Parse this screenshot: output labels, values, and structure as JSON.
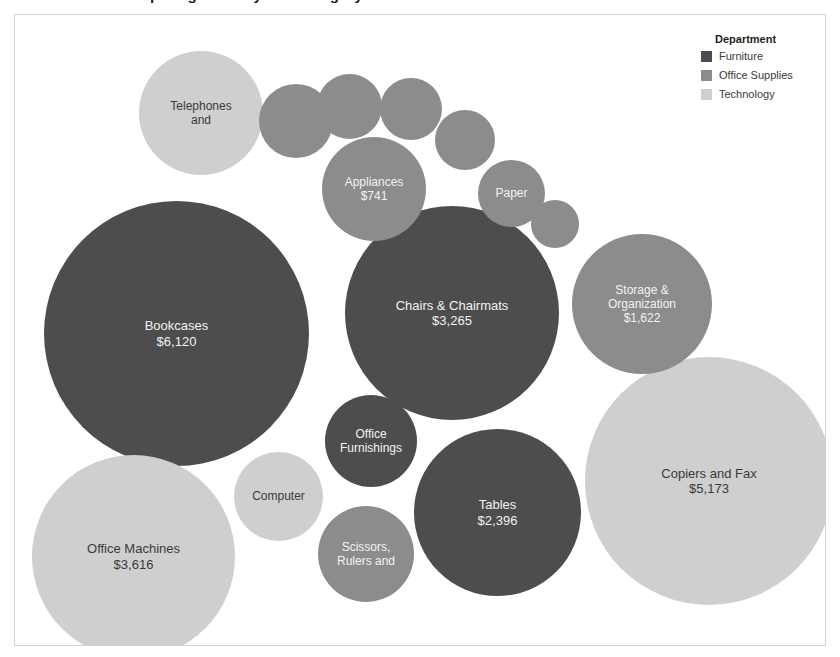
{
  "chart_title": "Bubble chart comparing sales by sub-category",
  "legend": {
    "title": "Department",
    "entries": [
      {
        "label": "Furniture",
        "color": "#4d4d4d"
      },
      {
        "label": "Office Supplies",
        "color": "#8c8c8c"
      },
      {
        "label": "Technology",
        "color": "#cfcfcf"
      }
    ]
  },
  "chart_data": {
    "type": "bubble",
    "title": "Bubble chart comparing sales by sub-category",
    "xlabel": "",
    "ylabel": "",
    "grid": false,
    "legend_position": "top-right",
    "legend_title": "Department",
    "categories": [
      "Furniture",
      "Office Supplies",
      "Technology"
    ],
    "category_colors": {
      "Furniture": "#4d4d4d",
      "Office Supplies": "#8c8c8c",
      "Technology": "#cfcfcf"
    },
    "value_prefix": "$",
    "points": [
      {
        "name": "Bookcases",
        "value": 6120,
        "value_label": "$6,120",
        "label": "Bookcases\n$6,120",
        "category": "Furniture"
      },
      {
        "name": "Copiers and Fax",
        "value": 5173,
        "value_label": "$5,173",
        "label": "Copiers and Fax\n$5,173",
        "category": "Technology"
      },
      {
        "name": "Office Machines",
        "value": 3616,
        "value_label": "$3,616",
        "label": "Office Machines\n$3,616",
        "category": "Technology"
      },
      {
        "name": "Chairs & Chairmats",
        "value": 3265,
        "value_label": "$3,265",
        "label": "Chairs & Chairmats\n$3,265",
        "category": "Furniture"
      },
      {
        "name": "Tables",
        "value": 2396,
        "value_label": "$2,396",
        "label": "Tables\n$2,396",
        "category": "Furniture"
      },
      {
        "name": "Storage & Organization",
        "value": 1622,
        "value_label": "$1,622",
        "label": "Storage &\nOrganization\n$1,622",
        "category": "Office Supplies"
      },
      {
        "name": "Telephones and",
        "value": null,
        "value_label": "",
        "label": "Telephones\nand",
        "category": "Technology"
      },
      {
        "name": "Appliances",
        "value": 741,
        "value_label": "$741",
        "label": "Appliances\n$741",
        "category": "Office Supplies"
      },
      {
        "name": "Office Furnishings",
        "value": null,
        "value_label": "",
        "label": "Office\nFurnishings",
        "category": "Furniture"
      },
      {
        "name": "Scissors, Rulers and",
        "value": null,
        "value_label": "",
        "label": "Scissors,\nRulers and",
        "category": "Office Supplies"
      },
      {
        "name": "Computer",
        "value": null,
        "value_label": "",
        "label": "Computer",
        "category": "Technology"
      },
      {
        "name": "Paper",
        "value": null,
        "value_label": "",
        "label": "Paper",
        "category": "Office Supplies"
      },
      {
        "name": "unlabeled-1",
        "value": null,
        "value_label": "",
        "label": "",
        "category": "Office Supplies"
      },
      {
        "name": "unlabeled-2",
        "value": null,
        "value_label": "",
        "label": "",
        "category": "Office Supplies"
      },
      {
        "name": "unlabeled-3",
        "value": null,
        "value_label": "",
        "label": "",
        "category": "Office Supplies"
      },
      {
        "name": "unlabeled-4",
        "value": null,
        "value_label": "",
        "label": "",
        "category": "Office Supplies"
      },
      {
        "name": "unlabeled-5",
        "value": null,
        "value_label": "",
        "label": "",
        "category": "Office Supplies"
      }
    ]
  },
  "bubbles": [
    {
      "label": "Bookcases\n$6,120",
      "cls": "cat-furniture",
      "txt": "txt-light",
      "x": 29,
      "y": 186,
      "d": 265,
      "fs": 13
    },
    {
      "label": "Chairs & Chairmats\n$3,265",
      "cls": "cat-furniture",
      "txt": "txt-light",
      "x": 330,
      "y": 191,
      "d": 214,
      "fs": 13
    },
    {
      "label": "Copiers and Fax\n$5,173",
      "cls": "cat-technology",
      "txt": "txt-dark",
      "x": 570,
      "y": 342,
      "d": 248,
      "fs": 13
    },
    {
      "label": "Office Machines\n$3,616",
      "cls": "cat-technology",
      "txt": "txt-dark",
      "x": 17,
      "y": 440,
      "d": 203,
      "fs": 13
    },
    {
      "label": "Tables\n$2,396",
      "cls": "cat-furniture",
      "txt": "txt-light",
      "x": 399,
      "y": 414,
      "d": 167,
      "fs": 13
    },
    {
      "label": "Storage &\nOrganization\n$1,622",
      "cls": "cat-office",
      "txt": "txt-light",
      "x": 557,
      "y": 219,
      "d": 140,
      "fs": 12
    },
    {
      "label": "Telephones\nand",
      "cls": "cat-technology",
      "txt": "txt-dark",
      "x": 124,
      "y": 36,
      "d": 124,
      "fs": 12
    },
    {
      "label": "Appliances\n$741",
      "cls": "cat-office",
      "txt": "txt-light",
      "x": 307,
      "y": 122,
      "d": 104,
      "fs": 12
    },
    {
      "label": "Office\nFurnishings",
      "cls": "cat-furniture",
      "txt": "txt-light",
      "x": 310,
      "y": 380,
      "d": 92,
      "fs": 12
    },
    {
      "label": "Scissors,\nRulers and",
      "cls": "cat-office",
      "txt": "txt-light",
      "x": 303,
      "y": 491,
      "d": 96,
      "fs": 12
    },
    {
      "label": "Computer",
      "cls": "cat-technology",
      "txt": "txt-dark",
      "x": 219,
      "y": 437,
      "d": 89,
      "fs": 12
    },
    {
      "label": "Paper",
      "cls": "cat-office",
      "txt": "txt-light",
      "x": 463,
      "y": 145,
      "d": 67,
      "fs": 12
    },
    {
      "label": "",
      "cls": "cat-office",
      "txt": "txt-light",
      "x": 244,
      "y": 69,
      "d": 74,
      "fs": 11
    },
    {
      "label": "",
      "cls": "cat-office",
      "txt": "txt-light",
      "x": 302,
      "y": 59,
      "d": 65,
      "fs": 11
    },
    {
      "label": "",
      "cls": "cat-office",
      "txt": "txt-light",
      "x": 365,
      "y": 63,
      "d": 62,
      "fs": 11
    },
    {
      "label": "",
      "cls": "cat-office",
      "txt": "txt-light",
      "x": 420,
      "y": 95,
      "d": 60,
      "fs": 11
    },
    {
      "label": "",
      "cls": "cat-office",
      "txt": "txt-light",
      "x": 516,
      "y": 185,
      "d": 48,
      "fs": 11
    }
  ]
}
